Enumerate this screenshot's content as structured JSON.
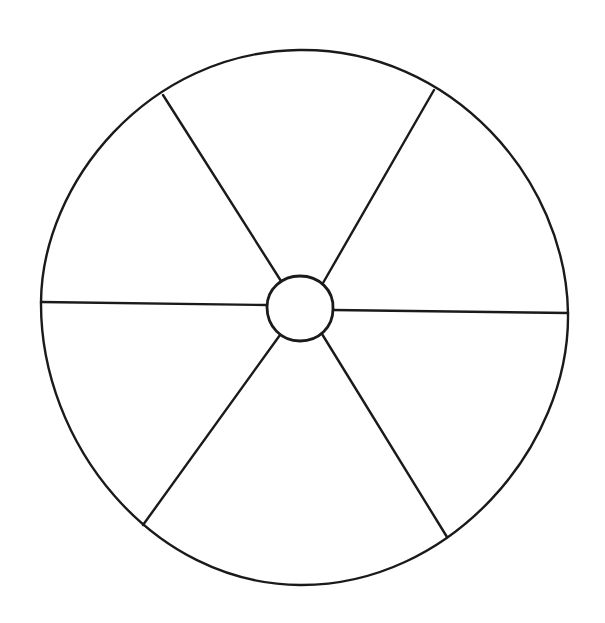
{
  "document": {
    "title": "Blank Wheel Diagram",
    "background_color": "#ffffff",
    "stroke_color": "#1a1a1a",
    "width": 605,
    "height": 623,
    "visible_text": []
  },
  "chart_data": {
    "type": "pie",
    "title": "",
    "subtitle": "",
    "xlabel": "",
    "ylabel": "",
    "grid": false,
    "legend_position": "none",
    "labels_shown": false,
    "values_shown": false,
    "categories": [
      "",
      "",
      "",
      "",
      "",
      ""
    ],
    "values": [
      1,
      1,
      1,
      1,
      1,
      1
    ],
    "geometry": {
      "outer_circle": {
        "cx": 305,
        "cy": 317,
        "r": 264
      },
      "hub_circle": {
        "cx": 300,
        "cy": 308,
        "r": 33
      },
      "spoke_count": 6,
      "spoke_endpoints": [
        {
          "name": "upper-left",
          "x": 163,
          "y": 95
        },
        {
          "name": "upper-right",
          "x": 434,
          "y": 90
        },
        {
          "name": "left",
          "x": 41,
          "y": 302
        },
        {
          "name": "right",
          "x": 568,
          "y": 313
        },
        {
          "name": "lower-left",
          "x": 143,
          "y": 525
        },
        {
          "name": "lower-right",
          "x": 447,
          "y": 537
        }
      ],
      "hub_exit_points": [
        {
          "name": "upper-left",
          "x": 281,
          "y": 281
        },
        {
          "name": "upper-right",
          "x": 323,
          "y": 283
        },
        {
          "name": "left",
          "x": 267,
          "y": 305
        },
        {
          "name": "right",
          "x": 333,
          "y": 310
        },
        {
          "name": "lower-left",
          "x": 280,
          "y": 335
        },
        {
          "name": "lower-right",
          "x": 322,
          "y": 334
        }
      ]
    },
    "segments": [
      {
        "id": "segment-top",
        "label": "",
        "value": 1,
        "fill": "#ffffff"
      },
      {
        "id": "segment-upper-right",
        "label": "",
        "value": 1,
        "fill": "#ffffff"
      },
      {
        "id": "segment-lower-right",
        "label": "",
        "value": 1,
        "fill": "#ffffff"
      },
      {
        "id": "segment-bottom",
        "label": "",
        "value": 1,
        "fill": "#ffffff"
      },
      {
        "id": "segment-lower-left",
        "label": "",
        "value": 1,
        "fill": "#ffffff"
      },
      {
        "id": "segment-upper-left",
        "label": "",
        "value": 1,
        "fill": "#ffffff"
      }
    ]
  },
  "strokes": {
    "outer_circle_width": 2.4,
    "hub_circle_width": 2.8,
    "spoke_width": 2.4
  }
}
